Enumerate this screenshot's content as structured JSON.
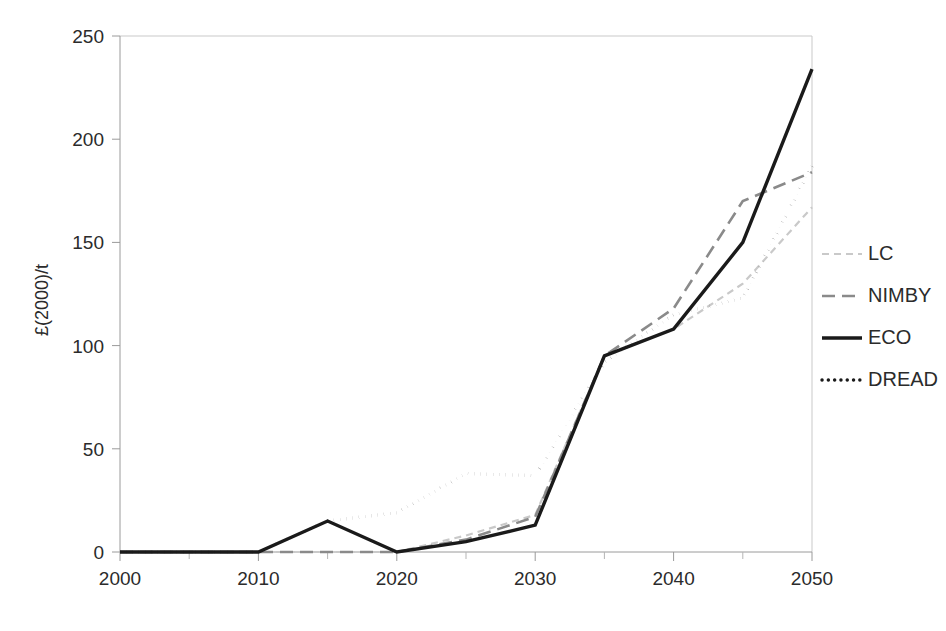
{
  "chart_data": {
    "type": "line",
    "title": "",
    "subtitle": "",
    "xlabel": "",
    "ylabel": "£(2000)/t",
    "xlim": [
      2000,
      2050
    ],
    "ylim": [
      0,
      250
    ],
    "grid": false,
    "legend_position": "right",
    "x": [
      2000,
      2010,
      2015,
      2020,
      2025,
      2030,
      2035,
      2040,
      2045,
      2050
    ],
    "x_tick_labels": [
      "2000",
      "2010",
      "2020",
      "2030",
      "2040",
      "2050"
    ],
    "x_tick_values": [
      2000,
      2010,
      2020,
      2030,
      2040,
      2050
    ],
    "x_minor_tick_values": [
      2005,
      2015,
      2025,
      2035,
      2045
    ],
    "y_tick_labels": [
      "0",
      "50",
      "100",
      "150",
      "200",
      "250"
    ],
    "y_tick_values": [
      0,
      50,
      100,
      150,
      200,
      250
    ],
    "series": [
      {
        "name": "LC",
        "style": "thin-light-dashed",
        "color": "#c9c9c9",
        "values": [
          0,
          0,
          0,
          0,
          8,
          18,
          95,
          108,
          130,
          167
        ]
      },
      {
        "name": "NIMBY",
        "style": "dashed",
        "color": "#8a8a8a",
        "values": [
          0,
          0,
          0,
          0,
          6,
          17,
          95,
          118,
          170,
          184
        ]
      },
      {
        "name": "ECO",
        "style": "solid-thick",
        "color": "#1a1a1a",
        "values": [
          0,
          0,
          15,
          0,
          5,
          13,
          95,
          108,
          150,
          234
        ]
      },
      {
        "name": "DREAD",
        "style": "dotted",
        "color": "#1a1a1a",
        "values": [
          0,
          0,
          15,
          19,
          38,
          37,
          92,
          115,
          123,
          187
        ]
      }
    ]
  },
  "legend": {
    "entries": [
      {
        "label": "LC"
      },
      {
        "label": "NIMBY"
      },
      {
        "label": "ECO"
      },
      {
        "label": "DREAD"
      }
    ]
  },
  "colors": {
    "lc": "#c9c9c9",
    "nimby": "#8a8a8a",
    "eco": "#1a1a1a",
    "dread": "#1a1a1a",
    "axis": "#9a9a9a",
    "frame": "#c9c9c9",
    "text": "#2b2b2b",
    "background": "#ffffff"
  }
}
